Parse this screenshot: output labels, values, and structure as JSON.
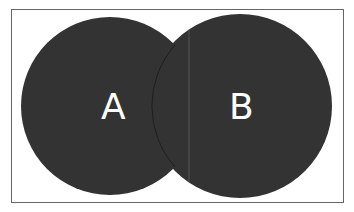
{
  "diagram": {
    "type": "venn",
    "sets": [
      {
        "label": "A",
        "color": "#333333"
      },
      {
        "label": "B",
        "color": "#333333"
      }
    ],
    "border_color": "#666666"
  }
}
